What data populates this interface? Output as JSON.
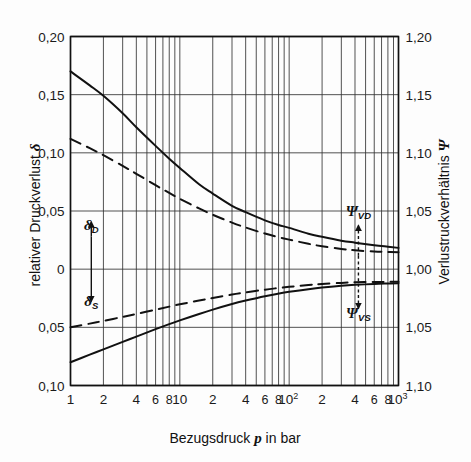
{
  "chart_data": {
    "type": "line",
    "title": "",
    "xlabel": "Bezugsdruck p in bar",
    "ylabel_left": "relativer Druckverlust δ",
    "ylabel_right": "Verlustruckverhältnis Ψ",
    "xscale": "log",
    "xlim": [
      1,
      1000
    ],
    "ylim_left": [
      -0.1,
      0.2
    ],
    "ylim_right": [
      1.1,
      1.2
    ],
    "grid": true,
    "legend_position": "inline-annotations",
    "x_tick_labels": [
      "1",
      "2",
      "4",
      "6",
      "8",
      "10",
      "2",
      "4",
      "6",
      "8",
      "10²",
      "2",
      "4",
      "6",
      "8",
      "10³"
    ],
    "x_tick_values": [
      1,
      2,
      4,
      6,
      8,
      10,
      20,
      40,
      60,
      80,
      100,
      200,
      400,
      600,
      800,
      1000
    ],
    "y_left_tick_labels": [
      "0,20",
      "0,15",
      "0,10",
      "0,05",
      "0",
      "0,05",
      "0,10"
    ],
    "y_left_tick_values": [
      0.2,
      0.15,
      0.1,
      0.05,
      0.0,
      -0.05,
      -0.1
    ],
    "y_right_tick_labels": [
      "1,20",
      "1,15",
      "1,10",
      "1,05",
      "1,00",
      "1,05",
      "1,10"
    ],
    "y_right_tick_values": [
      1.2,
      1.15,
      1.1,
      1.05,
      1.0,
      1.05,
      1.1
    ],
    "annotations": [
      {
        "name": "delta-D",
        "text": "δ",
        "sub": "D",
        "x": 1.55,
        "y": 0.034
      },
      {
        "name": "delta-S",
        "text": "δ",
        "sub": "S",
        "x": 1.55,
        "y": -0.032
      },
      {
        "name": "psi-VD",
        "text": "Ψ",
        "sub": "VD",
        "x": 430,
        "y": 0.046
      },
      {
        "name": "psi-VS",
        "text": "Ψ",
        "sub": "VS",
        "x": 430,
        "y": -0.042
      }
    ],
    "series": [
      {
        "name": "δ_D solid (upper, Druckseite)",
        "style": "solid",
        "x": [
          1,
          1.5,
          2,
          3,
          4,
          6,
          8,
          10,
          15,
          20,
          30,
          40,
          60,
          80,
          100,
          150,
          200,
          300,
          400,
          600,
          800,
          1000
        ],
        "values": [
          0.17,
          0.158,
          0.149,
          0.134,
          0.122,
          0.106,
          0.095,
          0.087,
          0.073,
          0.065,
          0.0545,
          0.049,
          0.042,
          0.038,
          0.0355,
          0.0305,
          0.0278,
          0.0245,
          0.0228,
          0.0206,
          0.0193,
          0.0183
        ]
      },
      {
        "name": "δ_D dashed (upper)",
        "style": "dashed",
        "x": [
          1,
          1.5,
          2,
          3,
          4,
          6,
          8,
          10,
          15,
          20,
          30,
          40,
          60,
          80,
          100,
          150,
          200,
          300,
          400,
          600,
          800,
          1000
        ],
        "values": [
          0.112,
          0.104,
          0.098,
          0.0888,
          0.082,
          0.0722,
          0.0655,
          0.0605,
          0.0522,
          0.0468,
          0.04,
          0.0358,
          0.0306,
          0.0275,
          0.0254,
          0.0218,
          0.0197,
          0.0174,
          0.0162,
          0.0152,
          0.0148,
          0.0146
        ]
      },
      {
        "name": "δ_S solid (lower, Saugseite)",
        "style": "solid",
        "x": [
          1,
          1.5,
          2,
          3,
          4,
          6,
          8,
          10,
          15,
          20,
          30,
          40,
          60,
          80,
          100,
          150,
          200,
          300,
          400,
          600,
          800,
          1000
        ],
        "values": [
          -0.08,
          -0.0735,
          -0.069,
          -0.0625,
          -0.058,
          -0.0516,
          -0.0472,
          -0.044,
          -0.0385,
          -0.0348,
          -0.03,
          -0.027,
          -0.0232,
          -0.021,
          -0.0195,
          -0.0172,
          -0.0158,
          -0.0143,
          -0.0135,
          -0.0127,
          -0.0123,
          -0.012
        ]
      },
      {
        "name": "δ_S dashed (lower)",
        "style": "dashed",
        "x": [
          1,
          1.5,
          2,
          3,
          4,
          6,
          8,
          10,
          15,
          20,
          30,
          40,
          60,
          80,
          100,
          150,
          200,
          300,
          400,
          600,
          800,
          1000
        ],
        "values": [
          -0.05,
          -0.0468,
          -0.0445,
          -0.041,
          -0.0385,
          -0.0348,
          -0.0322,
          -0.0302,
          -0.027,
          -0.0248,
          -0.0218,
          -0.02,
          -0.0176,
          -0.0162,
          -0.0152,
          -0.0136,
          -0.0127,
          -0.0118,
          -0.0113,
          -0.011,
          -0.0109,
          -0.0108
        ]
      }
    ]
  },
  "figure": {
    "xaxis_label_main": "Bezugsdruck",
    "xaxis_label_var": "p",
    "xaxis_label_tail": "in bar",
    "yaxis_left_text": "relativer Druckverlust",
    "yaxis_left_symbol": "δ",
    "yaxis_right_text": "Verlustruckverhältnis",
    "yaxis_right_symbol": "Ψ",
    "colors": {
      "line": "#111111",
      "grid": "#333333",
      "background": "#fdfdfd"
    }
  }
}
